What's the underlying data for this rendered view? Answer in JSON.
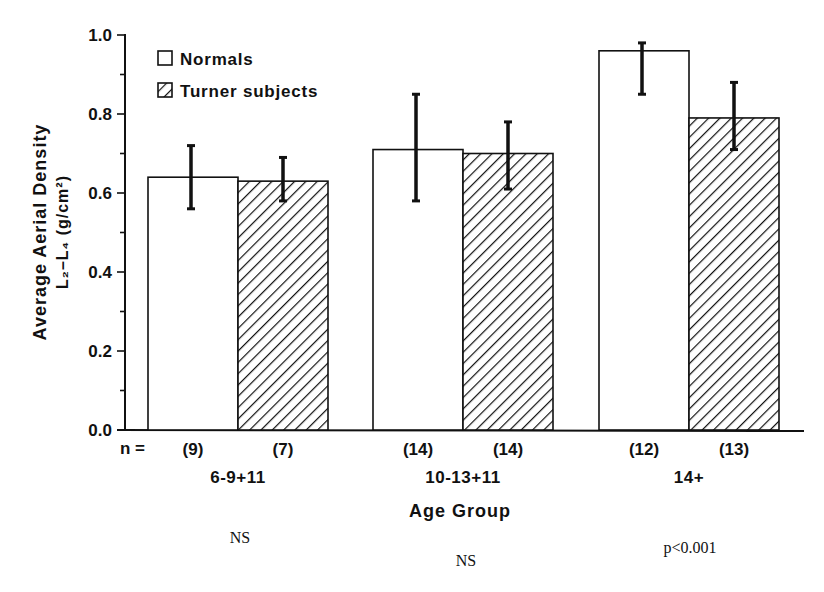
{
  "chart_data": {
    "type": "bar",
    "title": "",
    "xlabel": "Age Group",
    "ylabel": "Average Aerial Density",
    "ylabel_line2": "L₂–L₄ (g/cm²)",
    "ylim": [
      0.0,
      1.0
    ],
    "yticks": [
      "0.0",
      "0.2",
      "0.4",
      "0.6",
      "0.8",
      "1.0"
    ],
    "grid": false,
    "legend_position": "upper-left",
    "categories": [
      "6-9+11",
      "10-13+11",
      "14+"
    ],
    "series": [
      {
        "name": "Normals",
        "pattern": "solid-white",
        "values": [
          0.64,
          0.71,
          0.96
        ],
        "error_upper": [
          0.72,
          0.85,
          0.98
        ],
        "error_lower": [
          0.56,
          0.58,
          0.85
        ],
        "n": [
          "(9)",
          "(14)",
          "(12)"
        ]
      },
      {
        "name": "Turner subjects",
        "pattern": "diagonal-hatch",
        "values": [
          0.63,
          0.7,
          0.79
        ],
        "error_upper": [
          0.69,
          0.78,
          0.88
        ],
        "error_lower": [
          0.58,
          0.61,
          0.71
        ],
        "n": [
          "(7)",
          "(14)",
          "(13)"
        ]
      }
    ],
    "n_prefix": "n =",
    "significance": [
      "NS",
      "NS",
      "p<0.001"
    ]
  }
}
